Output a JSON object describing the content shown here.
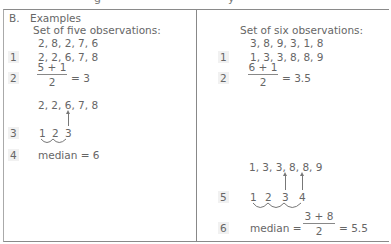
{
  "header": {
    "cut_text_left": "g",
    "cut_text_right": "y"
  },
  "section": {
    "label": "B.",
    "title": "Examples"
  },
  "left": {
    "heading": "Set of five observations:",
    "raw": "2, 8, 2, 7, 6",
    "steps": [
      {
        "num": "1",
        "text": "2, 2, 6, 7, 8"
      },
      {
        "num": "2",
        "numerator": "5 + 1",
        "denominator": "2",
        "result": "= 3"
      },
      {
        "num": "",
        "text": "2, 2, 6, 7, 8"
      },
      {
        "num": "3",
        "counts": [
          "1",
          "2",
          "3"
        ]
      },
      {
        "num": "4",
        "text": "median = 6"
      }
    ]
  },
  "right": {
    "heading": "Set of six observations:",
    "raw": "3, 8, 9, 3, 1, 8",
    "steps": [
      {
        "num": "1",
        "text": "1, 3, 3, 8, 8, 9"
      },
      {
        "num": "2",
        "numerator": "6 + 1",
        "denominator": "2",
        "result": "= 3.5"
      },
      {
        "num": "",
        "text": "1, 3, 3, 8, 8, 9"
      },
      {
        "num": "5",
        "counts": [
          "1",
          "2",
          "3",
          "4"
        ]
      },
      {
        "num": "6",
        "label": "median =",
        "numerator": "3 + 8",
        "denominator": "2",
        "result": "= 5.5"
      }
    ]
  }
}
